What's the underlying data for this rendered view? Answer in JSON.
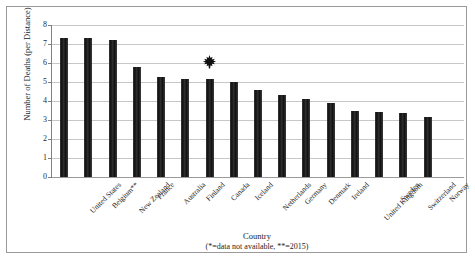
{
  "chart_data": {
    "type": "bar",
    "title": "",
    "xlabel": "Country",
    "xlabel_note": "(*=data not available, **=2015)",
    "ylabel": "Number of Deaths (per Distance)",
    "ylim": [
      0,
      8
    ],
    "ytick_labels": [
      "8",
      "7",
      "6",
      "5",
      "4",
      "3",
      "2",
      "1",
      "0"
    ],
    "yticks": [
      8,
      7,
      6,
      5,
      4,
      3,
      2,
      1,
      0
    ],
    "grid": true,
    "legend": "none",
    "bar_color": "#262626",
    "categories": [
      "United States",
      "Belgium**",
      "New Zealand",
      "France",
      "Australia",
      "Finland",
      "Canada",
      "Iceland",
      "Netherlands",
      "Germany",
      "Denmark",
      "Ireland",
      "United Kingdom",
      "Sweden",
      "Switzerland",
      "Norway",
      "Luxembourg*"
    ],
    "values": [
      7.3,
      7.3,
      7.2,
      5.8,
      5.25,
      5.15,
      5.15,
      5.0,
      4.6,
      4.3,
      4.1,
      3.9,
      3.5,
      3.4,
      3.35,
      3.15,
      0
    ],
    "annotations": [
      {
        "name": "maple-leaf-marker",
        "icon": "maple-leaf-icon",
        "category": "Canada",
        "value": 6.1,
        "color": "#111111"
      }
    ]
  }
}
